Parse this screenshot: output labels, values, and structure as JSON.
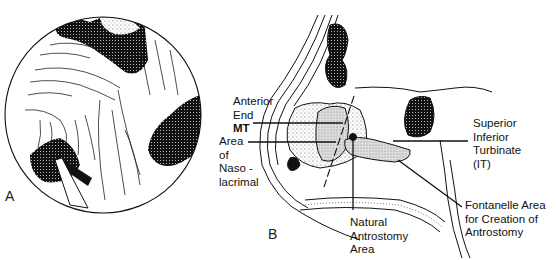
{
  "figure": {
    "panels": [
      {
        "id": "A",
        "letter": "A",
        "description": "Endoscopic view"
      },
      {
        "id": "B",
        "letter": "B",
        "description": "Sagittal section of lateral nasal wall"
      }
    ],
    "labels": {
      "anterior_end_mt": [
        "Anterior",
        "End",
        "MT"
      ],
      "area_of_nasolacrimal": [
        "Area",
        "of",
        "Naso -",
        "lacrimal"
      ],
      "superior_inferior_turbinate": [
        "Superior",
        "Inferior",
        "Turbinate",
        "(IT)"
      ],
      "natural_antrostomy": [
        "Natural",
        "Antrostomy",
        "Area"
      ],
      "fontanelle_area": [
        "Fontanelle Area",
        "for Creation of",
        "Antrostomy"
      ]
    },
    "colors": {
      "ink": "#111111",
      "background": "#ffffff",
      "stipple": "#9a9a9a"
    }
  }
}
